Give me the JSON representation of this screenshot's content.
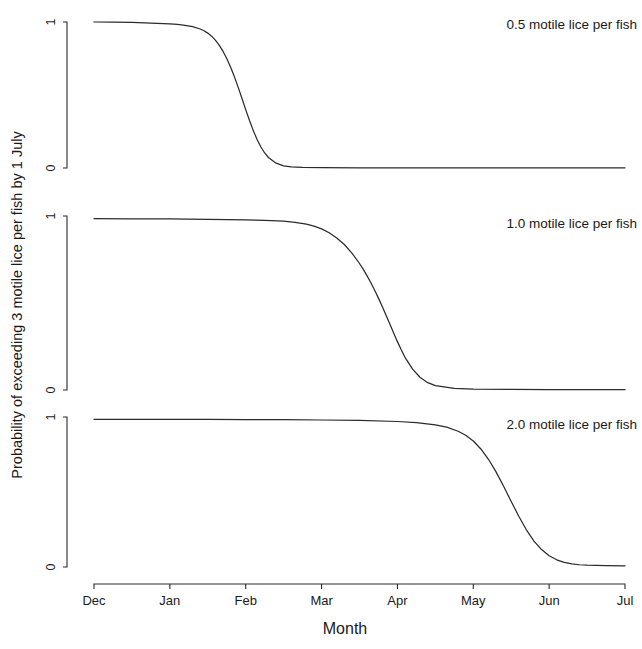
{
  "chart_data": {
    "type": "line",
    "title": "",
    "xlabel": "Month",
    "ylabel": "Probability of exceeding 3 motile lice per fish by 1 July",
    "xlim": [
      0,
      7
    ],
    "ylim": [
      0,
      1
    ],
    "grid": false,
    "legend_position": "panel-annotation",
    "x_tick_labels": [
      "Dec",
      "Jan",
      "Feb",
      "Mar",
      "Apr",
      "May",
      "Jun",
      "Jul"
    ],
    "x_tick_values": [
      0,
      1,
      2,
      3,
      4,
      5,
      6,
      7
    ],
    "y_tick_labels": [
      "0",
      "1"
    ],
    "y_tick_values": [
      0,
      1
    ],
    "panels": [
      {
        "label": "0.5 motile lice per fish",
        "x": [
          0.0,
          0.25,
          0.5,
          0.75,
          1.0,
          1.1,
          1.2,
          1.3,
          1.4,
          1.45,
          1.5,
          1.55,
          1.6,
          1.65,
          1.7,
          1.75,
          1.8,
          1.85,
          1.9,
          1.95,
          2.0,
          2.05,
          2.1,
          2.15,
          2.2,
          2.25,
          2.3,
          2.4,
          2.5,
          2.6,
          2.75,
          3.0,
          3.5,
          4.0,
          4.5,
          5.0,
          5.5,
          6.0,
          6.5,
          7.0
        ],
        "y": [
          1.0,
          0.999,
          0.997,
          0.993,
          0.987,
          0.983,
          0.977,
          0.968,
          0.952,
          0.94,
          0.924,
          0.903,
          0.876,
          0.842,
          0.8,
          0.75,
          0.692,
          0.626,
          0.554,
          0.478,
          0.4,
          0.325,
          0.256,
          0.195,
          0.144,
          0.103,
          0.072,
          0.033,
          0.015,
          0.008,
          0.004,
          0.002,
          0.001,
          0.001,
          0.001,
          0.001,
          0.001,
          0.001,
          0.001,
          0.001
        ]
      },
      {
        "label": "1.0 motile lice per fish",
        "x": [
          0.0,
          0.5,
          1.0,
          1.5,
          2.0,
          2.25,
          2.5,
          2.65,
          2.8,
          2.9,
          3.0,
          3.1,
          3.2,
          3.3,
          3.4,
          3.5,
          3.55,
          3.6,
          3.65,
          3.7,
          3.75,
          3.8,
          3.85,
          3.9,
          3.95,
          4.0,
          4.05,
          4.1,
          4.2,
          4.3,
          4.4,
          4.5,
          4.75,
          5.0,
          5.5,
          6.0,
          6.5,
          7.0
        ],
        "y": [
          0.985,
          0.984,
          0.983,
          0.981,
          0.978,
          0.975,
          0.97,
          0.964,
          0.953,
          0.942,
          0.926,
          0.904,
          0.874,
          0.836,
          0.787,
          0.727,
          0.693,
          0.656,
          0.616,
          0.573,
          0.528,
          0.48,
          0.43,
          0.379,
          0.328,
          0.278,
          0.231,
          0.188,
          0.12,
          0.072,
          0.042,
          0.025,
          0.009,
          0.005,
          0.003,
          0.002,
          0.002,
          0.002
        ]
      },
      {
        "label": "2.0 motile lice per fish",
        "x": [
          0.0,
          0.5,
          1.0,
          1.5,
          2.0,
          2.5,
          3.0,
          3.5,
          4.0,
          4.25,
          4.5,
          4.65,
          4.8,
          4.9,
          5.0,
          5.1,
          5.2,
          5.3,
          5.4,
          5.5,
          5.6,
          5.7,
          5.8,
          5.9,
          6.0,
          6.1,
          6.2,
          6.3,
          6.4,
          6.5,
          6.75,
          7.0
        ],
        "y": [
          0.985,
          0.985,
          0.984,
          0.984,
          0.983,
          0.982,
          0.98,
          0.977,
          0.97,
          0.962,
          0.948,
          0.932,
          0.905,
          0.878,
          0.84,
          0.787,
          0.718,
          0.634,
          0.538,
          0.437,
          0.338,
          0.248,
          0.173,
          0.116,
          0.075,
          0.048,
          0.031,
          0.021,
          0.015,
          0.012,
          0.009,
          0.008
        ]
      }
    ]
  },
  "axes": {
    "x_title": "Month",
    "y_title": "Probability of exceeding 3 motile lice per fish by 1 July"
  },
  "caption": {
    "text": ""
  },
  "colors": {
    "curve": "#2b2b2b",
    "axis": "#2b2b2b",
    "background": "#ffffff",
    "text": "#1a1a1a"
  }
}
